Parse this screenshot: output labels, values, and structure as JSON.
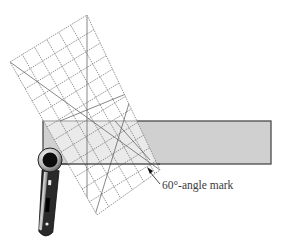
{
  "figure": {
    "kind": "quilting-cutting-illustration",
    "callout": {
      "label": "60°-angle mark"
    },
    "elements": {
      "fabric_strip": {
        "color": "#cfcfcf",
        "border": "#555555"
      },
      "ruler": {
        "grid": "dashed",
        "color": "#8a8a8a"
      },
      "rotary_cutter": {
        "body": "#2a2a2a",
        "highlight": "#e0e0e0"
      }
    }
  }
}
